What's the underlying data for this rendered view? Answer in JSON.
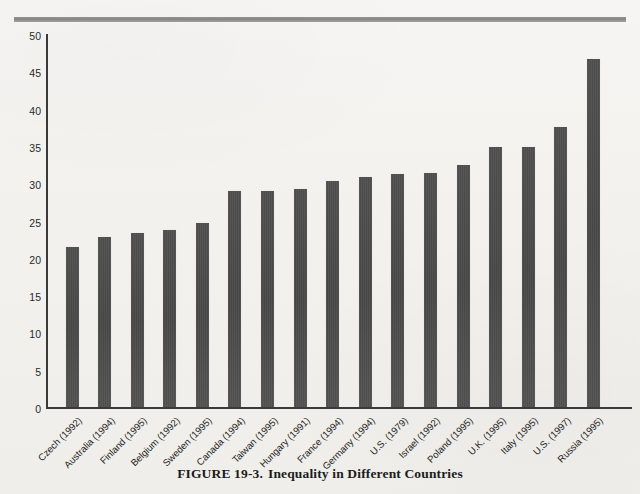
{
  "caption": {
    "figure_number": "FIGURE 19-3.",
    "title": "Inequality in Different Countries"
  },
  "chart_data": {
    "type": "bar",
    "title": "Inequality in Different Countries",
    "xlabel": "",
    "ylabel": "Gini coefficient of inequality",
    "ylim": [
      0,
      50
    ],
    "yticks": [
      0,
      5,
      10,
      15,
      20,
      25,
      30,
      35,
      40,
      45,
      50
    ],
    "grid": false,
    "legend": null,
    "bar_color": "#4b4b4b",
    "categories": [
      "Czech (1992)",
      "Australia (1994)",
      "Finland (1995)",
      "Belgium (1992)",
      "Sweden (1995)",
      "Canada (1994)",
      "Taiwan (1995)",
      "Hungary (1991)",
      "France (1994)",
      "Germany (1994)",
      "U.S. (1979)",
      "Israel (1992)",
      "Poland (1995)",
      "U.K. (1995)",
      "Italy (1995)",
      "U.S. (1997)",
      "Russia (1995)"
    ],
    "values": [
      21.4,
      22.8,
      23.3,
      23.7,
      24.7,
      28.9,
      28.9,
      29.2,
      30.3,
      30.8,
      31.2,
      31.4,
      32.5,
      34.8,
      34.8,
      37.6,
      46.6
    ]
  }
}
